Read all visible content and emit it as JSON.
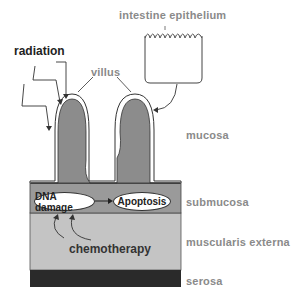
{
  "diagram": {
    "labels": {
      "epithelium": "intestine epithelium",
      "radiation": "radiation",
      "villus": "villus",
      "mucosa": "mucosa",
      "submucosa": "submucosa",
      "muscularis": "muscularis externa",
      "serosa": "serosa",
      "chemotherapy": "chemotherapy"
    },
    "nodes": {
      "dna_damage": "DNA damage",
      "apoptosis": "Apoptosis"
    },
    "colors": {
      "villus_fill": "#8c8c8c",
      "submucosa_fill": "#9a9a9a",
      "muscularis_fill": "#c4c4c4",
      "serosa_fill": "#2a2a2a",
      "label_gray": "#8a8a8a"
    }
  }
}
